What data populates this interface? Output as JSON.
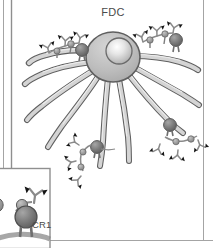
{
  "figure": {
    "kind": "biological-diagram",
    "background_color": "#ffffff"
  },
  "labels": {
    "cell_label": "FDC",
    "receptor_label": "CR1"
  },
  "colors": {
    "outline": "#555555",
    "dendrite_fill": "#c9c9c9",
    "dendrite_highlight": "#efefef",
    "cell_body_fill": "#b8b8b8",
    "nucleus_highlight": "#ffffff",
    "receptor_dark": "#6e6e6e",
    "receptor_mid": "#9a9a9a",
    "antibody_stem": "#8a8a8a",
    "antibody_tip": "#1a1a1a",
    "frame_line": "#9a9a9a",
    "label_text": "#4a4a4a"
  },
  "frame": {
    "left_rule_1_x": 3,
    "left_rule_2_x": 11,
    "right_rule_x": 203,
    "bottom_rule_y": 240,
    "inset_box": {
      "x": 0,
      "y": 168,
      "width": 50,
      "height": 80
    }
  },
  "cell_body": {
    "center_x": 113,
    "center_y": 57,
    "radius_x": 27,
    "radius_y": 25,
    "nucleus_center_x": 119,
    "nucleus_center_y": 51,
    "nucleus_radius": 13
  },
  "dendrites": [
    {
      "id": "dendrite-upper-left",
      "note": "extends left and slightly up"
    },
    {
      "id": "dendrite-left",
      "note": "extends far left, gently curved"
    },
    {
      "id": "dendrite-lower-left-1",
      "note": "sweeps down-left"
    },
    {
      "id": "dendrite-lower-left-2",
      "note": "sweeps down-left, inner"
    },
    {
      "id": "dendrite-down-center",
      "note": "descends near vertical"
    },
    {
      "id": "dendrite-down-right",
      "note": "descends right of center"
    },
    {
      "id": "dendrite-right-lower",
      "note": "extends right then down"
    },
    {
      "id": "dendrite-right",
      "note": "extends far right"
    },
    {
      "id": "dendrite-upper-right",
      "note": "extends right and up"
    }
  ],
  "immune_complexes": [
    {
      "id": "complex-upper-left",
      "location": "on upper-left dendrite",
      "receptor_count": 2,
      "antibody_count": 3
    },
    {
      "id": "complex-upper-right",
      "location": "on upper-right dendrite",
      "receptor_count": 2,
      "antibody_count": 3
    },
    {
      "id": "complex-lower-right",
      "location": "on lower-right dendrite",
      "receptor_count": 2,
      "antibody_count": 3
    },
    {
      "id": "complex-lower-center",
      "location": "on descending center dendrite",
      "receptor_count": 2,
      "antibody_count": 3
    }
  ],
  "inset": {
    "id": "cr1-detail-inset",
    "description": "magnified view of a CR1 receptor bound by antibody",
    "receptor_count": 2,
    "antibody_count": 2
  }
}
